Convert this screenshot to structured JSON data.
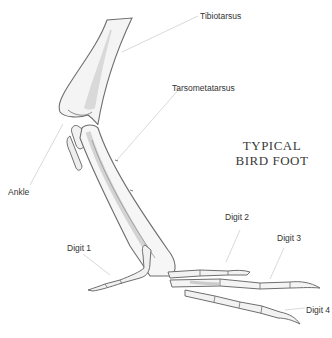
{
  "diagram": {
    "title_line1": "TYPICAL",
    "title_line2": "BIRD FOOT",
    "labels": {
      "tibiotarsus": "Tibiotarsus",
      "tarsometatarsus": "Tarsometatarsus",
      "ankle": "Ankle",
      "digit1": "Digit 1",
      "digit2": "Digit 2",
      "digit3": "Digit 3",
      "digit4": "Digit 4"
    },
    "colors": {
      "outline": "#6e6e6e",
      "shading": "#d8d8d8",
      "leader": "#c8c8c8",
      "text": "#333333"
    }
  }
}
